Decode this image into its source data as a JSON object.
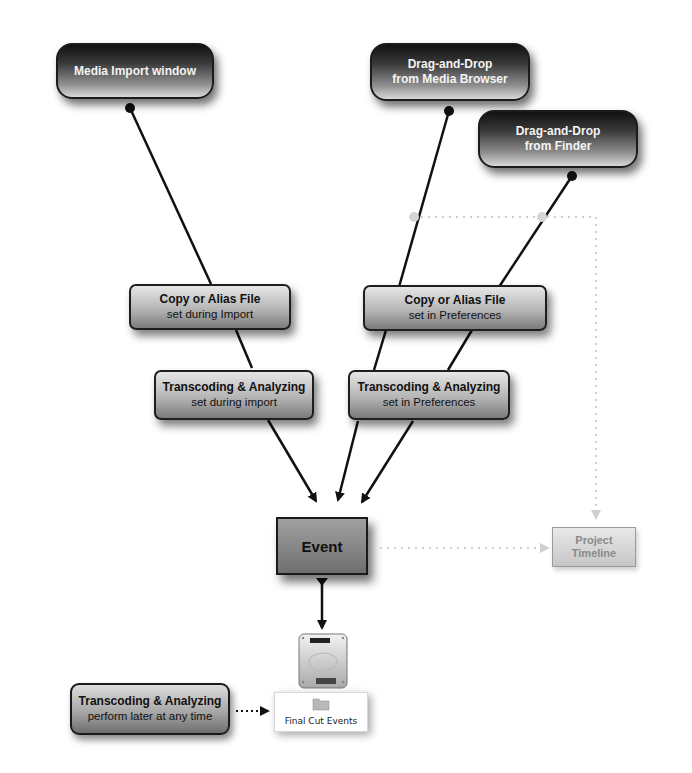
{
  "diagram": {
    "sources": [
      {
        "id": "media-import",
        "label": "Media Import window"
      },
      {
        "id": "media-browser",
        "line1": "Drag-and-Drop",
        "line2": "from Media Browser"
      },
      {
        "id": "finder",
        "line1": "Drag-and-Drop",
        "line2": "from Finder"
      }
    ],
    "copy_nodes": [
      {
        "title": "Copy or Alias File",
        "subtitle": "set during Import"
      },
      {
        "title": "Copy or Alias File",
        "subtitle": "set in Preferences"
      }
    ],
    "transcode_nodes": [
      {
        "title": "Transcoding & Analyzing",
        "subtitle": "set during import"
      },
      {
        "title": "Transcoding & Analyzing",
        "subtitle": "set in Preferences"
      }
    ],
    "event": {
      "label": "Event"
    },
    "timeline": {
      "line1": "Project",
      "line2": "Timeline"
    },
    "later": {
      "title": "Transcoding & Analyzing",
      "subtitle": "perform later at any time"
    },
    "storage": {
      "icon": "hard-drive-icon",
      "folder_icon": "folder-icon",
      "folder_label": "Final Cut Events"
    },
    "colors": {
      "line": "#111111",
      "dotted": "#cfcfcf",
      "junction": "#d6d6d6"
    }
  }
}
